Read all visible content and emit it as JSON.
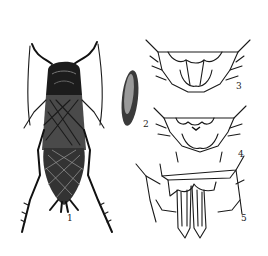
{
  "figure": {
    "colors": {
      "ink": "#1a1a1a",
      "background": "#ffffff",
      "egg_fill": "#3a3a3a"
    },
    "panels": [
      {
        "id": 1,
        "label": "1",
        "description": "whole insect, dorsal view"
      },
      {
        "id": 2,
        "label": "2",
        "description": "egg"
      },
      {
        "id": 3,
        "label": "3",
        "description": "abdomen tip detail"
      },
      {
        "id": 4,
        "label": "4",
        "description": "abdomen tip detail"
      },
      {
        "id": 5,
        "label": "5",
        "description": "abdomen tip with ovipositor"
      }
    ]
  }
}
